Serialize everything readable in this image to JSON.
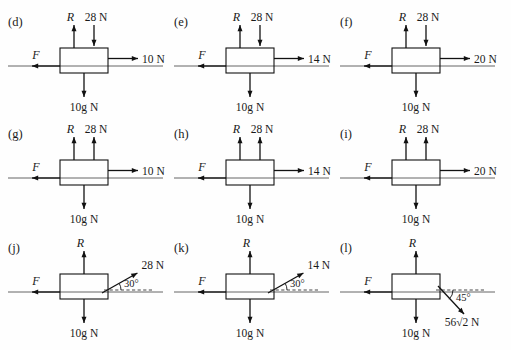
{
  "figure": {
    "columns": 3,
    "rows": 3,
    "ink_color": "#111111",
    "ground_color": "#555555"
  },
  "common": {
    "weight_label": "10g N",
    "normal_label": "R",
    "friction_label": "F",
    "degree_symbol": "°"
  },
  "panels": [
    {
      "id": "d",
      "label": "(d)",
      "row": 0,
      "col": 0,
      "normal": {
        "label": "R",
        "direction": "up"
      },
      "applied_vertical": {
        "value": "28 N",
        "direction": "down"
      },
      "applied_horizontal": {
        "value": "10 N",
        "direction": "right"
      },
      "friction": {
        "label": "F",
        "direction": "left"
      },
      "weight": {
        "label": "10g N",
        "direction": "down"
      },
      "angled": null
    },
    {
      "id": "e",
      "label": "(e)",
      "row": 0,
      "col": 1,
      "normal": {
        "label": "R",
        "direction": "up"
      },
      "applied_vertical": {
        "value": "28 N",
        "direction": "down"
      },
      "applied_horizontal": {
        "value": "14 N",
        "direction": "right"
      },
      "friction": {
        "label": "F",
        "direction": "left"
      },
      "weight": {
        "label": "10g N",
        "direction": "down"
      },
      "angled": null
    },
    {
      "id": "f",
      "label": "(f)",
      "row": 0,
      "col": 2,
      "normal": {
        "label": "R",
        "direction": "up"
      },
      "applied_vertical": {
        "value": "28 N",
        "direction": "down"
      },
      "applied_horizontal": {
        "value": "20 N",
        "direction": "right"
      },
      "friction": {
        "label": "F",
        "direction": "left"
      },
      "weight": {
        "label": "10g N",
        "direction": "down"
      },
      "angled": null
    },
    {
      "id": "g",
      "label": "(g)",
      "row": 1,
      "col": 0,
      "normal": {
        "label": "R",
        "direction": "up"
      },
      "applied_vertical": {
        "value": "28 N",
        "direction": "up"
      },
      "applied_horizontal": {
        "value": "10 N",
        "direction": "right"
      },
      "friction": {
        "label": "F",
        "direction": "left"
      },
      "weight": {
        "label": "10g N",
        "direction": "down"
      },
      "angled": null
    },
    {
      "id": "h",
      "label": "(h)",
      "row": 1,
      "col": 1,
      "normal": {
        "label": "R",
        "direction": "up"
      },
      "applied_vertical": {
        "value": "28 N",
        "direction": "up"
      },
      "applied_horizontal": {
        "value": "14 N",
        "direction": "right"
      },
      "friction": {
        "label": "F",
        "direction": "left"
      },
      "weight": {
        "label": "10g N",
        "direction": "down"
      },
      "angled": null
    },
    {
      "id": "i",
      "label": "(i)",
      "row": 1,
      "col": 2,
      "normal": {
        "label": "R",
        "direction": "up"
      },
      "applied_vertical": {
        "value": "28 N",
        "direction": "up"
      },
      "applied_horizontal": {
        "value": "20 N",
        "direction": "right"
      },
      "friction": {
        "label": "F",
        "direction": "left"
      },
      "weight": {
        "label": "10g N",
        "direction": "down"
      },
      "angled": null
    },
    {
      "id": "j",
      "label": "(j)",
      "row": 2,
      "col": 0,
      "normal": {
        "label": "R",
        "direction": "up"
      },
      "applied_vertical": null,
      "applied_horizontal": null,
      "friction": {
        "label": "F",
        "direction": "left"
      },
      "weight": {
        "label": "10g N",
        "direction": "down"
      },
      "angled": {
        "value": "28 N",
        "angle_text": "30°",
        "angle_deg": 30,
        "sense": "up-right",
        "dashed_reference": true
      }
    },
    {
      "id": "k",
      "label": "(k)",
      "row": 2,
      "col": 1,
      "normal": {
        "label": "R",
        "direction": "up"
      },
      "applied_vertical": null,
      "applied_horizontal": null,
      "friction": {
        "label": "F",
        "direction": "left"
      },
      "weight": {
        "label": "10g N",
        "direction": "down"
      },
      "angled": {
        "value": "14 N",
        "angle_text": "30°",
        "angle_deg": 30,
        "sense": "up-right",
        "dashed_reference": true
      }
    },
    {
      "id": "l",
      "label": "(l)",
      "row": 2,
      "col": 2,
      "normal": {
        "label": "R",
        "direction": "up"
      },
      "applied_vertical": null,
      "applied_horizontal": null,
      "friction": {
        "label": "F",
        "direction": "left"
      },
      "weight": {
        "label": "10g N",
        "direction": "down"
      },
      "angled": {
        "value": "56√2 N",
        "angle_text": "45°",
        "angle_deg": 45,
        "sense": "down-right",
        "dashed_reference": true
      }
    }
  ]
}
